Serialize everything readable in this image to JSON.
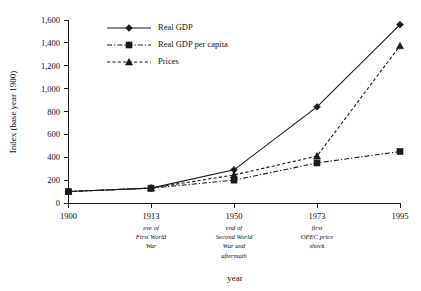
{
  "chart_data": {
    "type": "line",
    "title": "",
    "xlabel": "year",
    "ylabel": "Index (base year 1900)",
    "categories": [
      "1900",
      "1913",
      "1950",
      "1973",
      "1995"
    ],
    "category_notes": [
      "",
      "eve of\nFirst World\nWar",
      "end of\nSecond World\nWar and\naftermath",
      "first\nOPEC price\nshock",
      ""
    ],
    "ylim": [
      0,
      1600
    ],
    "yticks": [
      0,
      200,
      400,
      600,
      800,
      1000,
      1200,
      1400,
      1600
    ],
    "ytick_labels": [
      "0",
      "200",
      "400",
      "600",
      "800",
      "1,000",
      "1,200",
      "1,400",
      "1,600"
    ],
    "grid": false,
    "legend_position": "top-left",
    "series": [
      {
        "name": "Real GDP",
        "marker": "diamond",
        "linestyle": "solid",
        "values": [
          100,
          130,
          290,
          840,
          1560
        ]
      },
      {
        "name": "Real GDP per capita",
        "marker": "square",
        "linestyle": "dashdot",
        "values": [
          100,
          130,
          200,
          350,
          450
        ]
      },
      {
        "name": "Prices",
        "marker": "triangle",
        "linestyle": "dashed",
        "values": [
          100,
          130,
          245,
          410,
          1375
        ]
      }
    ]
  },
  "style": {
    "ink": "#1a1a1a",
    "background": "#ffffff"
  }
}
